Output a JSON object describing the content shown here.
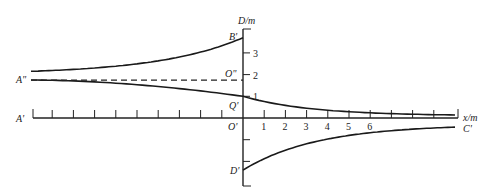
{
  "figure": {
    "axis_labels": {
      "y_axis": "D/m",
      "x_axis": "x/m"
    },
    "x_ticks": [
      "1",
      "2",
      "3",
      "4",
      "5",
      "6"
    ],
    "y_ticks": [
      "1",
      "2",
      "3"
    ],
    "point_labels": {
      "A_double": "A\"",
      "A_prime": "A'",
      "B_prime": "B'",
      "O_double": "O\"",
      "Q_prime": "Q'",
      "O_prime": "O'",
      "C_prime": "C'",
      "D_prime": "D'"
    },
    "values": {
      "x_min": -10,
      "x_max": 10,
      "x_labeled_max": 6,
      "y_axis_top": 3.7,
      "y_axis_bottom": -3,
      "B_prime_D": 3.7,
      "O_double_D": 1.75,
      "Q_prime_D": 1.0,
      "A_double_upper_D": 2.15,
      "A_double_lower_D": 1.75,
      "D_prime_D": -2.4,
      "C_prime_D": 0.1
    },
    "curves": [
      {
        "name": "upper-curve",
        "from": "A\"",
        "to": "B'",
        "x_range": [
          -10,
          0
        ],
        "D_start": 2.15,
        "D_end": 3.7
      },
      {
        "name": "middle-curve",
        "from": "A\"",
        "to": "C'",
        "x_range": [
          -10,
          10
        ],
        "D_start": 1.75,
        "D_at_zero": 1.0,
        "D_end": 0.1
      },
      {
        "name": "lower-curve",
        "from": "D'",
        "to": "C'",
        "x_range": [
          0,
          10
        ],
        "D_start": -2.4,
        "D_end": -0.3
      },
      {
        "name": "dashed-line",
        "from": "A\"",
        "to": "O\"",
        "x_range": [
          -10,
          0
        ],
        "D": 1.75
      }
    ]
  }
}
